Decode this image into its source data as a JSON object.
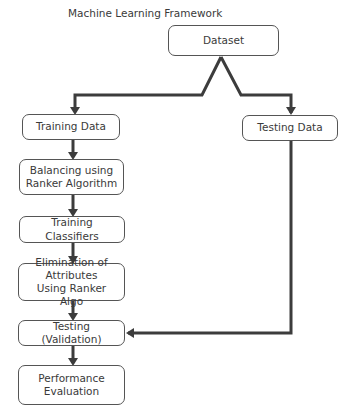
{
  "title": "Machine Learning Framework",
  "nodes": {
    "dataset": "Dataset",
    "training_data": "Training Data",
    "testing_data": "Testing Data",
    "balancing": "Balancing using Ranker Algorithm",
    "training_classifiers": "Training Classifiers",
    "elimination": "Elimination of Attributes Using Ranker Algo",
    "testing_validation": "Testing (Validation)",
    "performance": "Performance Evaluation"
  },
  "edges": [
    {
      "from": "dataset",
      "to": "training_data"
    },
    {
      "from": "dataset",
      "to": "testing_data"
    },
    {
      "from": "training_data",
      "to": "balancing"
    },
    {
      "from": "balancing",
      "to": "training_classifiers"
    },
    {
      "from": "training_classifiers",
      "to": "elimination"
    },
    {
      "from": "elimination",
      "to": "testing_validation"
    },
    {
      "from": "testing_data",
      "to": "testing_validation"
    },
    {
      "from": "testing_validation",
      "to": "performance"
    }
  ],
  "colors": {
    "line": "#3c3c3c",
    "box_border": "#555555"
  }
}
